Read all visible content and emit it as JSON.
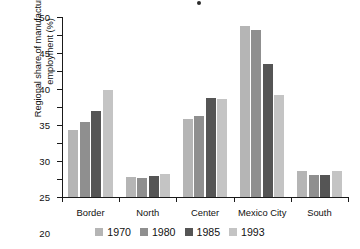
{
  "chart_data": {
    "type": "bar",
    "title": "",
    "subtitle": "",
    "xlabel": "",
    "ylabel": "Regional share of manufacturing\nemployment (%)",
    "ylim": [
      0,
      50
    ],
    "ytick_step": 5,
    "yticks": [
      "50",
      "45",
      "40",
      "35",
      "30",
      "25",
      "20",
      "15",
      "10",
      "5",
      "0"
    ],
    "grid": false,
    "legend_position": "bottom",
    "categories": [
      "Border",
      "North",
      "Center",
      "Mexico City",
      "South"
    ],
    "series": [
      {
        "name": "1970",
        "color": "#b5b5b5",
        "values": [
          18.6,
          5.5,
          21.6,
          47.4,
          7.1
        ]
      },
      {
        "name": "1980",
        "color": "#8f8f8f",
        "values": [
          20.9,
          5.2,
          22.6,
          46.4,
          6.2
        ]
      },
      {
        "name": "1985",
        "color": "#555555",
        "values": [
          23.8,
          5.8,
          27.6,
          37.0,
          6.2
        ]
      },
      {
        "name": "1993",
        "color": "#c4c4c4",
        "values": [
          29.8,
          6.3,
          27.1,
          28.2,
          7.2
        ]
      }
    ]
  },
  "legend": {
    "items": [
      {
        "label": "1970",
        "color": "#b5b5b5"
      },
      {
        "label": "1980",
        "color": "#8f8f8f"
      },
      {
        "label": "1985",
        "color": "#555555"
      },
      {
        "label": "1993",
        "color": "#c4c4c4"
      }
    ]
  }
}
